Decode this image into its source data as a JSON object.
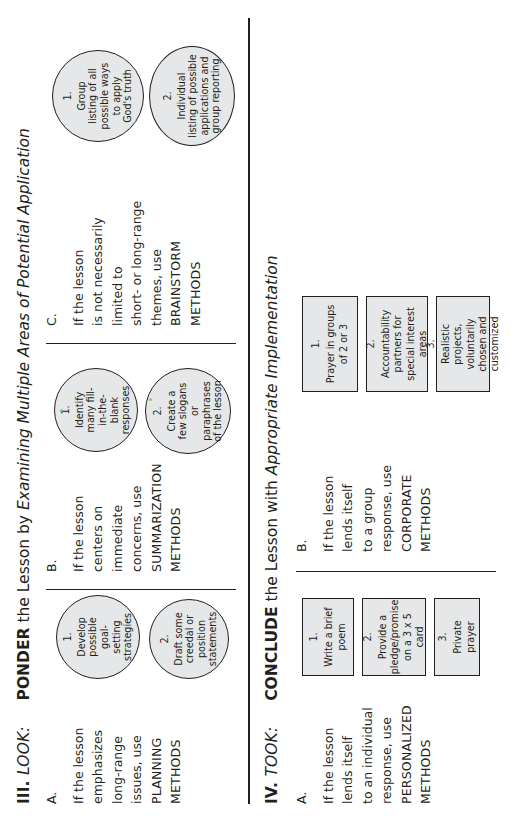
{
  "document": {
    "page_background": "#ffffff",
    "ink_color": "#231f20",
    "shape_fill": "#e6e7e8"
  },
  "sections": [
    {
      "id": "look",
      "roman": "III.",
      "roman_word": "LOOK:",
      "heading_strong": "PONDER",
      "heading_rest": " the Lesson by ",
      "heading_italic": "Examining Multiple Areas of Potential Application",
      "columns": [
        {
          "letter": "A.",
          "lines": [
            "If the lesson",
            "emphasizes",
            "long-range",
            "issues, use",
            "PLANNING",
            "METHODS"
          ],
          "shapes": [
            {
              "kind": "ellipse",
              "num": "1.",
              "text": [
                "Develop",
                "possible",
                "goal-",
                "setting",
                "strategies"
              ]
            },
            {
              "kind": "ellipse",
              "num": "2.",
              "text": [
                "Draft some",
                "creedal or",
                "position",
                "statements"
              ]
            }
          ]
        },
        {
          "letter": "B.",
          "lines": [
            "If the lesson",
            "centers on",
            "immediate",
            "concerns, use",
            "SUMMARIZATION",
            "METHODS"
          ],
          "shapes": [
            {
              "kind": "ellipse",
              "num": "1.",
              "text": [
                "Identify",
                "many fill-",
                "in-the-",
                "blank",
                "responses"
              ]
            },
            {
              "kind": "ellipse",
              "num": "2.",
              "text": [
                "Create a",
                "few slogans",
                "or paraphrases",
                "of the lesson"
              ]
            }
          ]
        },
        {
          "letter": "C.",
          "lines": [
            "If the lesson",
            "is not necessarily",
            "limited to",
            "short- or long-range",
            "themes, use",
            "BRAINSTORM",
            "METHODS"
          ],
          "shapes": [
            {
              "kind": "ellipse",
              "num": "1.",
              "text": [
                "Group",
                "listing of all",
                "possible ways",
                "to apply",
                "God's truth"
              ]
            },
            {
              "kind": "ellipse",
              "num": "2.",
              "text": [
                "Individual",
                "listing of possible",
                "applications and",
                "group reporting"
              ]
            }
          ]
        }
      ]
    },
    {
      "id": "took",
      "roman": "IV.",
      "roman_word": "TOOK:",
      "heading_strong": "CONCLUDE",
      "heading_rest": " the Lesson with ",
      "heading_italic": "Appropriate Implementation",
      "columns": [
        {
          "letter": "A.",
          "lines": [
            "If the lesson",
            "lends itself",
            "to an individual",
            "response, use",
            "PERSONALIZED",
            "METHODS"
          ],
          "shapes": [
            {
              "kind": "rectbox",
              "num": "1.",
              "text": [
                "Write a brief poem"
              ]
            },
            {
              "kind": "rectbox",
              "num": "2.",
              "text": [
                "Provide a pledge/promise",
                "on a 3 x 5 card"
              ]
            },
            {
              "kind": "rectbox",
              "num": "3.",
              "text": [
                "Private prayer"
              ]
            }
          ]
        },
        {
          "letter": "B.",
          "lines": [
            "If the lesson",
            "lends itself",
            "to a group",
            "response, use",
            "CORPORATE",
            "METHODS"
          ],
          "shapes": [
            {
              "kind": "rectbox",
              "num": "1.",
              "text": [
                "Prayer in groups of 2 or 3"
              ]
            },
            {
              "kind": "rectbox",
              "num": "2.",
              "text": [
                "Accountability partners for",
                "special interest areas"
              ]
            },
            {
              "kind": "rectbox",
              "num": "3.",
              "text": [
                "Realistic projects, voluntarily",
                "chosen and customized"
              ]
            }
          ]
        }
      ]
    }
  ]
}
